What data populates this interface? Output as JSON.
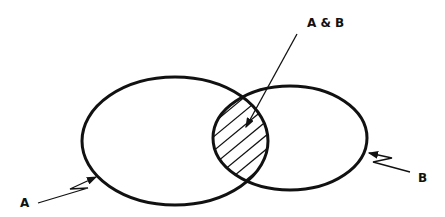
{
  "diagram": {
    "type": "venn",
    "sets": [
      {
        "id": "A",
        "label": "A",
        "cx": 175,
        "cy": 141,
        "rx": 93,
        "ry": 64
      },
      {
        "id": "B",
        "label": "B",
        "cx": 290,
        "cy": 138,
        "rx": 77,
        "ry": 52
      }
    ],
    "intersection": {
      "label": "A & B",
      "shaded": true,
      "pattern": "diagonal-hatch"
    },
    "colors": {
      "stroke": "#111111",
      "background": "#ffffff"
    }
  }
}
